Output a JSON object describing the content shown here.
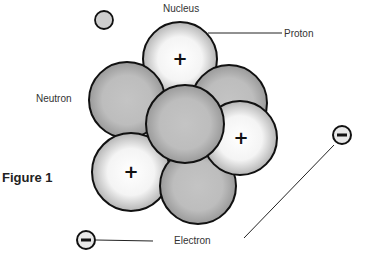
{
  "labels": {
    "nucleus": "Nucleus",
    "proton": "Proton",
    "neutron": "Neutron",
    "electron": "Electron",
    "figure": "Figure 1"
  },
  "symbols": {
    "proton_charge": "+",
    "electron_charge": "−"
  },
  "colors": {
    "neutron_fill": "#bdbdbd",
    "proton_fill": "#ffffff",
    "outline": "#111111",
    "label_text": "#333333"
  },
  "particles": {
    "protons": 3,
    "neutrons": 4,
    "electrons": 2
  }
}
